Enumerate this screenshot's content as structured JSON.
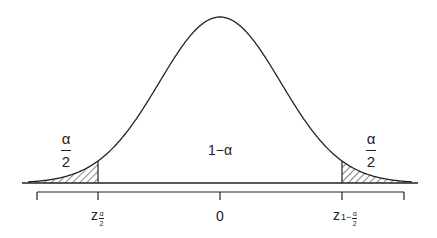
{
  "figure": {
    "title": "",
    "center_label": "1−α",
    "left_tail": {
      "numerator": "α",
      "denominator": "2"
    },
    "right_tail": {
      "numerator": "α",
      "denominator": "2"
    },
    "axis_labels": {
      "left_z": "z",
      "left_sub_num": "α",
      "left_sub_den": "2",
      "center": "0",
      "right_z": "z",
      "right_sub_prefix": "1−",
      "right_sub_num": "α",
      "right_sub_den": "2"
    },
    "colors": {
      "stroke": "#222222",
      "background": "#ffffff"
    }
  },
  "chart_data": {
    "type": "area",
    "title": "",
    "xlabel": "",
    "ylabel": "",
    "distribution": "normal",
    "mean": 0,
    "x_ticks": [
      "",
      "z_{α/2}",
      "0",
      "z_{1−α/2}",
      ""
    ],
    "shaded_regions": [
      {
        "name": "left tail",
        "range": [
          "-inf",
          "z_{α/2}"
        ],
        "area_label": "α/2",
        "pattern": "hatched"
      },
      {
        "name": "right tail",
        "range": [
          "z_{1−α/2}",
          "+inf"
        ],
        "area_label": "α/2",
        "pattern": "hatched"
      }
    ],
    "center_area_label": "1−α",
    "grid": false,
    "legend": "none"
  }
}
